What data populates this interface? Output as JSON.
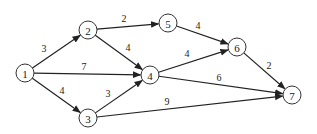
{
  "diagram": {
    "type": "directed-weighted-graph",
    "nodes": [
      {
        "id": "1",
        "label": "1",
        "x": 25,
        "y": 73
      },
      {
        "id": "2",
        "label": "2",
        "x": 88,
        "y": 30
      },
      {
        "id": "3",
        "label": "3",
        "x": 88,
        "y": 118
      },
      {
        "id": "4",
        "label": "4",
        "x": 150,
        "y": 75
      },
      {
        "id": "5",
        "label": "5",
        "x": 168,
        "y": 23
      },
      {
        "id": "6",
        "label": "6",
        "x": 237,
        "y": 47
      },
      {
        "id": "7",
        "label": "7",
        "x": 292,
        "y": 95
      }
    ],
    "edges": [
      {
        "from": "1",
        "to": "2",
        "weight": "3",
        "lx": 44,
        "ly": 48
      },
      {
        "from": "1",
        "to": "4",
        "weight": "7",
        "lx": 84,
        "ly": 66
      },
      {
        "from": "1",
        "to": "3",
        "weight": "4",
        "lx": 62,
        "ly": 90
      },
      {
        "from": "2",
        "to": "5",
        "weight": "2",
        "lx": 124,
        "ly": 18
      },
      {
        "from": "2",
        "to": "4",
        "weight": "4",
        "lx": 128,
        "ly": 47
      },
      {
        "from": "3",
        "to": "4",
        "weight": "3",
        "lx": 108,
        "ly": 93
      },
      {
        "from": "3",
        "to": "7",
        "weight": "9",
        "lx": 167,
        "ly": 101
      },
      {
        "from": "5",
        "to": "6",
        "weight": "4",
        "lx": 198,
        "ly": 25
      },
      {
        "from": "4",
        "to": "6",
        "weight": "4",
        "lx": 187,
        "ly": 53
      },
      {
        "from": "4",
        "to": "7",
        "weight": "6",
        "lx": 219,
        "ly": 77
      },
      {
        "from": "6",
        "to": "7",
        "weight": "2",
        "lx": 269,
        "ly": 65
      }
    ],
    "node_radius": 9,
    "colors": {
      "stroke": "#222222",
      "node_fill": "#ffffff"
    }
  }
}
